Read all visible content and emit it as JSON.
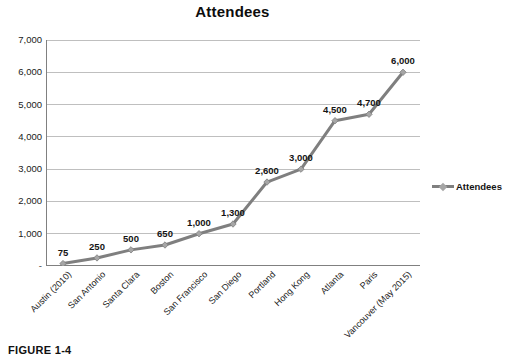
{
  "figure": {
    "caption": "FIGURE 1-4"
  },
  "legend": {
    "position": "right",
    "entries": [
      {
        "label": "Attendees",
        "color": "#7f7f7f",
        "marker": "diamond-marker"
      }
    ]
  },
  "colors": {
    "series_line": "#7f7f7f",
    "marker_fill": "#a6a6a6",
    "gridline": "#bfbfbf",
    "axis": "#808080",
    "text": "#141414",
    "background": "#ffffff"
  },
  "chart_data": {
    "type": "line",
    "title": "Attendees",
    "xlabel": "",
    "ylabel": "",
    "categories": [
      "Austin (2010)",
      "San Antonio",
      "Santa Clara",
      "Boston",
      "San Francisco",
      "San Diego",
      "Portland",
      "Hong Kong",
      "Atlanta",
      "Paris",
      "Vancouver (May 2015)"
    ],
    "series": [
      {
        "name": "Attendees",
        "values": [
          75,
          250,
          500,
          650,
          1000,
          1300,
          2600,
          3000,
          4500,
          4700,
          6000
        ],
        "point_labels": [
          "75",
          "250",
          "500",
          "650",
          "1,000",
          "1,300",
          "2,600",
          "3,000",
          "4,500",
          "4,700",
          "6,000"
        ]
      }
    ],
    "ylim": [
      0,
      7000
    ],
    "ytick_values": [
      0,
      1000,
      2000,
      3000,
      4000,
      5000,
      6000,
      7000
    ],
    "ytick_labels": [
      "-",
      "1,000",
      "2,000",
      "3,000",
      "4,000",
      "5,000",
      "6,000",
      "7,000"
    ],
    "grid": "horizontal",
    "legend_position": "right",
    "marker": "diamond"
  }
}
